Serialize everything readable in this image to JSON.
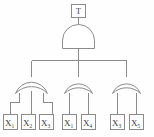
{
  "diagram": {
    "kind": "fault-tree",
    "title": "T",
    "colors": {
      "stroke": "#8b8b8b",
      "text": "#3a3a3a",
      "background": "#fefefe",
      "fill": "#ffffff"
    }
  },
  "top_event": {
    "label": "T",
    "name": "top-event"
  },
  "gates": [
    {
      "id": "G0",
      "type": "AND",
      "name": "and-gate-top",
      "inputs": [
        "G1",
        "G2",
        "G3"
      ]
    },
    {
      "id": "G1",
      "type": "OR",
      "name": "or-gate-left",
      "inputs": [
        "E1",
        "E2",
        "E3"
      ]
    },
    {
      "id": "G2",
      "type": "OR",
      "name": "or-gate-middle",
      "inputs": [
        "E4",
        "E5"
      ]
    },
    {
      "id": "G3",
      "type": "OR",
      "name": "or-gate-right",
      "inputs": [
        "E6",
        "E7"
      ]
    }
  ],
  "basic_events": [
    {
      "id": "E1",
      "base": "X",
      "sub": "1",
      "group": "left"
    },
    {
      "id": "E2",
      "base": "X",
      "sub": "2",
      "group": "left"
    },
    {
      "id": "E3",
      "base": "X",
      "sub": "3",
      "group": "left"
    },
    {
      "id": "E4",
      "base": "X",
      "sub": "1",
      "group": "middle"
    },
    {
      "id": "E5",
      "base": "X",
      "sub": "4",
      "group": "middle"
    },
    {
      "id": "E6",
      "base": "X",
      "sub": "3",
      "group": "right"
    },
    {
      "id": "E7",
      "base": "X",
      "sub": "5",
      "group": "right"
    }
  ]
}
